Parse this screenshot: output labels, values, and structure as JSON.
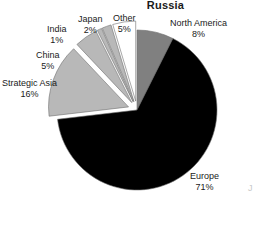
{
  "chart_data": {
    "type": "pie",
    "title": "Russia",
    "xlabel": "",
    "ylabel": "",
    "legend_position": "none",
    "grid": false,
    "units": "percent",
    "categories": [
      "North America",
      "Europe",
      "Strategic Asia",
      "China",
      "India",
      "Japan",
      "Other"
    ],
    "values": [
      8,
      71,
      16,
      5,
      1,
      2,
      5
    ],
    "value_labels": [
      "8%",
      "71%",
      "16%",
      "5%",
      "1%",
      "2%",
      "5%"
    ],
    "slices": [
      {
        "name": "North America",
        "value": 8,
        "value_label": "8%",
        "color": "#808080",
        "exploded": false,
        "label_x": 170,
        "label_y": 18
      },
      {
        "name": "Europe",
        "value": 71,
        "value_label": "71%",
        "color": "#000000",
        "exploded": false,
        "label_x": 190,
        "label_y": 171
      },
      {
        "name": "Strategic Asia",
        "value": 16,
        "value_label": "16%",
        "color": "#b8b8b8",
        "exploded": true,
        "label_x": 2,
        "label_y": 78
      },
      {
        "name": "China",
        "value": 5,
        "value_label": "5%",
        "color": "#b8b8b8",
        "exploded": true,
        "label_x": 36,
        "label_y": 50
      },
      {
        "name": "India",
        "value": 1,
        "value_label": "1%",
        "color": "#b8b8b8",
        "exploded": true,
        "label_x": 47,
        "label_y": 24
      },
      {
        "name": "Japan",
        "value": 2,
        "value_label": "2%",
        "color": "#b8b8b8",
        "exploded": true,
        "label_x": 78,
        "label_y": 14
      },
      {
        "name": "Other",
        "value": 5,
        "value_label": "5%",
        "color": "#ffffff",
        "exploded": true,
        "label_x": 113,
        "label_y": 13
      }
    ]
  },
  "artifacts": {
    "edge_fragment_text": "J"
  }
}
